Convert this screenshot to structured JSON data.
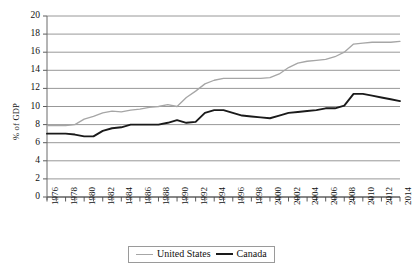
{
  "chart_data": {
    "type": "line",
    "title": "",
    "xlabel": "",
    "ylabel": "% of GDP",
    "ylim": [
      0,
      20
    ],
    "ytick_values": [
      0,
      2,
      4,
      6,
      8,
      10,
      12,
      14,
      16,
      18,
      20
    ],
    "ytick_labels": [
      "0",
      "2",
      "4",
      "6",
      "8",
      "10",
      "12",
      "14",
      "16",
      "18",
      "20"
    ],
    "grid": true,
    "legend_position": "bottom-center",
    "xlim": [
      1976,
      2014
    ],
    "x": [
      1976,
      1977,
      1978,
      1979,
      1980,
      1981,
      1982,
      1983,
      1984,
      1985,
      1986,
      1987,
      1988,
      1989,
      1990,
      1991,
      1992,
      1993,
      1994,
      1995,
      1996,
      1997,
      1998,
      1999,
      2000,
      2001,
      2002,
      2003,
      2004,
      2005,
      2006,
      2007,
      2008,
      2009,
      2010,
      2011,
      2012,
      2013,
      2014
    ],
    "xtick_labels": [
      "1976",
      "1978",
      "1980",
      "1982",
      "1984",
      "1986",
      "1988",
      "1990",
      "1992",
      "1994",
      "1996",
      "1998",
      "2000",
      "2002",
      "2004",
      "2006",
      "2008",
      "2010",
      "2012",
      "2014"
    ],
    "series": [
      {
        "name": "United States",
        "color": "#a6a6a6",
        "values": [
          7.9,
          7.9,
          7.9,
          8.0,
          8.6,
          8.9,
          9.3,
          9.5,
          9.4,
          9.6,
          9.7,
          9.9,
          10.0,
          10.2,
          10.0,
          11.0,
          11.7,
          12.5,
          12.9,
          13.1,
          13.1,
          13.1,
          13.1,
          13.1,
          13.2,
          13.6,
          14.3,
          14.8,
          15.0,
          15.1,
          15.2,
          15.5,
          16.0,
          16.9,
          17.0,
          17.1,
          17.1,
          17.1,
          17.2
        ]
      },
      {
        "name": "Canada",
        "color": "#1a1a1a",
        "values": [
          7.0,
          7.0,
          7.0,
          6.9,
          6.7,
          6.7,
          7.3,
          7.6,
          7.7,
          8.0,
          8.0,
          8.0,
          8.0,
          8.2,
          8.5,
          8.2,
          8.3,
          9.3,
          9.6,
          9.6,
          9.3,
          9.0,
          8.9,
          8.8,
          8.7,
          9.0,
          9.3,
          9.4,
          9.5,
          9.6,
          9.8,
          9.8,
          10.1,
          11.4,
          11.4,
          11.2,
          11.0,
          10.8,
          10.6
        ]
      }
    ]
  },
  "legend": {
    "entries": [
      {
        "label": "United States"
      },
      {
        "label": "Canada"
      }
    ]
  }
}
